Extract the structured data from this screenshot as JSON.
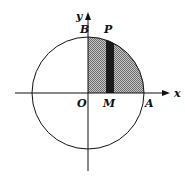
{
  "diagram": {
    "type": "unit-circle-quadrant-area",
    "center": [
      88,
      93
    ],
    "radius": 56,
    "labels": {
      "x_axis": "x",
      "y_axis": "y",
      "origin": "O",
      "B": "B",
      "P": "P",
      "M": "M",
      "A": "A"
    },
    "colors": {
      "stroke": "#111111",
      "shade": "#9a9a9a",
      "strip": "#1a1a1a"
    }
  }
}
